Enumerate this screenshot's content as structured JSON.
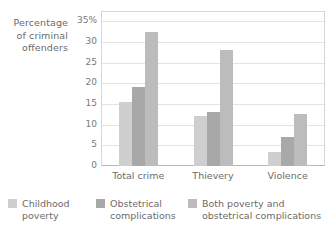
{
  "chart_data": {
    "type": "bar",
    "title": "",
    "subtitle": "",
    "xlabel": "",
    "ylabel": "Percentage of criminal offenders",
    "categories": [
      "Total crime",
      "Thievery",
      "Violence"
    ],
    "series": [
      {
        "name": "Childhood poverty",
        "values": [
          15.5,
          12,
          3.5
        ],
        "color": "#cfcfcf"
      },
      {
        "name": "Obstetrical complications",
        "values": [
          19,
          13,
          7
        ],
        "color": "#a8a8a8"
      },
      {
        "name": "Both poverty and obstetrical complications",
        "values": [
          32.5,
          28,
          12.5
        ],
        "color": "#bcbcbc"
      }
    ],
    "ylim": [
      0,
      37.5
    ],
    "yticks": [
      0,
      5,
      10,
      15,
      20,
      25,
      30,
      35
    ],
    "ytick_labels": [
      "0",
      "5",
      "10",
      "15",
      "20",
      "25",
      "30",
      "35%"
    ],
    "grid": true,
    "legend_position": "bottom"
  },
  "axis": {
    "y_title_lines": [
      "Percentage",
      "of criminal",
      "offenders"
    ]
  },
  "legend": {
    "items": [
      {
        "label": "Childhood\npoverty",
        "color": "#cfcfcf"
      },
      {
        "label": "Obstetrical\ncomplications",
        "color": "#a8a8a8"
      },
      {
        "label": "Both poverty and\nobstetrical complications",
        "color": "#bcbcbc"
      }
    ]
  },
  "colors": {
    "background": "#ffffff",
    "text": "#6b6b6b",
    "gridline": "#e3e3e3",
    "frame": "#d6d6d6",
    "baseline": "#b9b9b9"
  }
}
